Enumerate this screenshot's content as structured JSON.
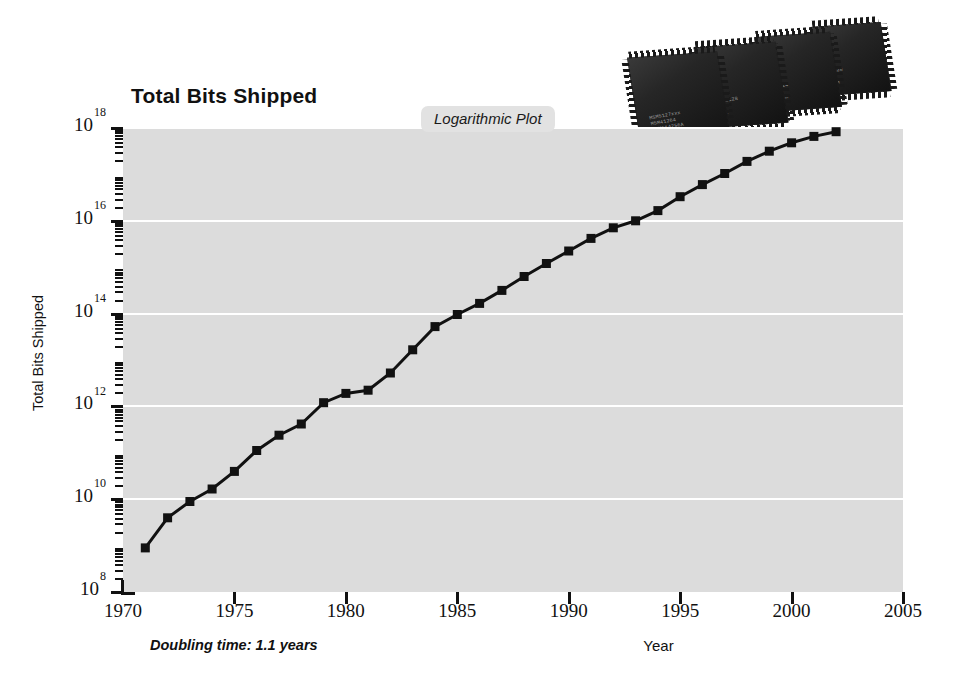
{
  "chart_data": {
    "type": "line",
    "title": "Total Bits Shipped",
    "xlabel": "Year",
    "ylabel": "Total Bits Shipped",
    "xlim": [
      1970,
      2005
    ],
    "ylim_exponent": [
      8,
      18
    ],
    "log_scale_y": true,
    "grid": "horizontal-major-white",
    "legend": "none",
    "annotations": [
      {
        "name": "logarithmic-plot-badge",
        "text": "Logarithmic Plot"
      },
      {
        "name": "doubling-time-note",
        "text": "Doubling time: 1.1 years"
      }
    ],
    "xticks": [
      "1970",
      "1975",
      "1980",
      "1985",
      "1990",
      "1995",
      "2000",
      "2005"
    ],
    "xtick_values": [
      1970,
      1975,
      1980,
      1985,
      1990,
      1995,
      2000,
      2005
    ],
    "yticks": [
      "10^8",
      "10^10",
      "10^12",
      "10^14",
      "10^16",
      "10^18"
    ],
    "ytick_mantissa": "10",
    "ytick_exponents": [
      "8",
      "10",
      "12",
      "14",
      "16",
      "18"
    ],
    "marker": "square",
    "marker_color": "#111111",
    "line_color": "#111111",
    "plot_background": "#dcdcdc",
    "x": [
      1971,
      1972,
      1973,
      1974,
      1975,
      1976,
      1977,
      1978,
      1979,
      1980,
      1981,
      1982,
      1983,
      1984,
      1985,
      1986,
      1987,
      1988,
      1989,
      1990,
      1991,
      1992,
      1993,
      1994,
      1995,
      1996,
      1997,
      1998,
      1999,
      2000,
      2001,
      2002
    ],
    "y_log10": [
      8.95,
      9.6,
      9.95,
      10.22,
      10.6,
      11.05,
      11.38,
      11.62,
      12.08,
      12.28,
      12.35,
      12.72,
      13.22,
      13.72,
      13.98,
      14.22,
      14.5,
      14.8,
      15.08,
      15.35,
      15.62,
      15.85,
      16.0,
      16.22,
      16.52,
      16.78,
      17.02,
      17.28,
      17.5,
      17.68,
      17.82,
      17.92
    ],
    "y_values_label": "bits shipped (log scale)"
  },
  "chips": [
    {
      "name": "memory-chip-1",
      "markings": "MSM5127xxx\nM5M41264\nMCM514256A"
    },
    {
      "name": "memory-chip-2",
      "markings": "HM628128\n1M1\nDRAM"
    },
    {
      "name": "memory-chip-3",
      "markings": "HM514\n256\n128M"
    },
    {
      "name": "memory-chip-4",
      "markings": "K4S28\n16\n28M"
    }
  ]
}
